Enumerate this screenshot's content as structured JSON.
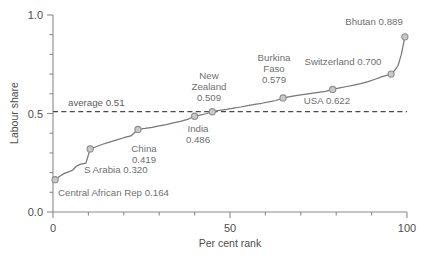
{
  "chart_data": {
    "type": "line",
    "title": "",
    "xlabel": "Per cent rank",
    "ylabel": "Labour share",
    "xlim": [
      0,
      100
    ],
    "ylim": [
      0,
      1.0
    ],
    "grid": false,
    "legend": "none",
    "x_ticks": [
      {
        "value": 0,
        "label": "0",
        "major": true
      },
      {
        "value": 10,
        "label": "",
        "major": false
      },
      {
        "value": 20,
        "label": "",
        "major": false
      },
      {
        "value": 30,
        "label": "",
        "major": false
      },
      {
        "value": 40,
        "label": "",
        "major": false
      },
      {
        "value": 50,
        "label": "50",
        "major": true
      },
      {
        "value": 60,
        "label": "",
        "major": false
      },
      {
        "value": 70,
        "label": "",
        "major": false
      },
      {
        "value": 80,
        "label": "",
        "major": false
      },
      {
        "value": 90,
        "label": "",
        "major": false
      },
      {
        "value": 100,
        "label": "100",
        "major": true
      }
    ],
    "y_ticks": [
      {
        "value": 0.0,
        "label": "0.0",
        "major": true
      },
      {
        "value": 0.1,
        "label": "",
        "major": false
      },
      {
        "value": 0.2,
        "label": "",
        "major": false
      },
      {
        "value": 0.3,
        "label": "",
        "major": false
      },
      {
        "value": 0.4,
        "label": "",
        "major": false
      },
      {
        "value": 0.5,
        "label": "0.5",
        "major": true
      },
      {
        "value": 0.6,
        "label": "",
        "major": false
      },
      {
        "value": 0.7,
        "label": "",
        "major": false
      },
      {
        "value": 0.8,
        "label": "",
        "major": false
      },
      {
        "value": 0.9,
        "label": "",
        "major": false
      },
      {
        "value": 1.0,
        "label": "1.0",
        "major": true
      }
    ],
    "reference_line": {
      "orientation": "horizontal",
      "value": 0.51,
      "label": "average 0.51",
      "style": "dashed"
    },
    "x": [
      0.6,
      2.0,
      3.2,
      4.4,
      5.5,
      6.6,
      7.6,
      9.3,
      10.5,
      12.0,
      14.0,
      16.0,
      18.0,
      20.0,
      22.0,
      24.0,
      26.0,
      28.0,
      30.0,
      32.0,
      34.0,
      36.0,
      38.0,
      40.0,
      41.5,
      43.5,
      45.0,
      47.0,
      49.0,
      51.0,
      53.0,
      55.0,
      57.0,
      59.0,
      61.0,
      63.0,
      65.0,
      67.0,
      69.0,
      71.0,
      73.0,
      75.0,
      77.0,
      79.0,
      81.0,
      83.0,
      85.0,
      87.0,
      89.0,
      91.0,
      93.0,
      95.5,
      96.5,
      97.5,
      98.4,
      99.4
    ],
    "y": [
      0.164,
      0.183,
      0.196,
      0.204,
      0.212,
      0.232,
      0.242,
      0.248,
      0.32,
      0.33,
      0.344,
      0.355,
      0.366,
      0.377,
      0.386,
      0.419,
      0.424,
      0.43,
      0.437,
      0.444,
      0.452,
      0.46,
      0.47,
      0.486,
      0.492,
      0.5,
      0.509,
      0.516,
      0.521,
      0.527,
      0.533,
      0.54,
      0.546,
      0.552,
      0.559,
      0.566,
      0.579,
      0.586,
      0.592,
      0.597,
      0.602,
      0.607,
      0.612,
      0.622,
      0.63,
      0.637,
      0.644,
      0.652,
      0.662,
      0.674,
      0.687,
      0.7,
      0.718,
      0.745,
      0.8,
      0.889
    ],
    "annotated_points": [
      {
        "name": "Central African Rep",
        "value": 0.164,
        "rank": 0.6,
        "label": "Central African Rep 0.164"
      },
      {
        "name": "S Arabia",
        "value": 0.32,
        "rank": 10.5,
        "label": "S Arabia 0.320"
      },
      {
        "name": "China",
        "value": 0.419,
        "rank": 24.0,
        "label": "China 0.419"
      },
      {
        "name": "India",
        "value": 0.486,
        "rank": 40.0,
        "label": "India 0.486"
      },
      {
        "name": "New Zealand",
        "value": 0.509,
        "rank": 45.0,
        "label": "New Zealand 0.509"
      },
      {
        "name": "Burkina Faso",
        "value": 0.579,
        "rank": 65.0,
        "label": "Burkina Faso 0.579"
      },
      {
        "name": "USA",
        "value": 0.622,
        "rank": 79.0,
        "label": "USA 0.622"
      },
      {
        "name": "Switzerland",
        "value": 0.7,
        "rank": 95.5,
        "label": "Switzerland 0.700"
      },
      {
        "name": "Bhutan",
        "value": 0.889,
        "rank": 99.4,
        "label": "Bhutan 0.889"
      }
    ],
    "annotation_text": {
      "central_african_rep": "Central African Rep 0.164",
      "s_arabia": "S Arabia 0.320",
      "china_l1": "China",
      "china_l2": "0.419",
      "india_l1": "India",
      "india_l2": "0.486",
      "new_zealand_l1": "New",
      "new_zealand_l2": "Zealand",
      "new_zealand_l3": "0.509",
      "burkina_l1": "Burkina",
      "burkina_l2": "Faso",
      "burkina_l3": "0.579",
      "usa": "USA 0.622",
      "switzerland": "Switzerland 0.700",
      "bhutan": "Bhutan 0.889",
      "average": "average 0.51"
    },
    "colors": {
      "line": "#777777",
      "marker_fill": "#c9c9c9",
      "marker_stroke": "#8e8e8e",
      "axis": "#8a8a8a",
      "text": "#4d4d4d",
      "annotation_text": "#6f6f6f",
      "reference_line": "#4a4a4a",
      "background": "#ffffff"
    }
  }
}
